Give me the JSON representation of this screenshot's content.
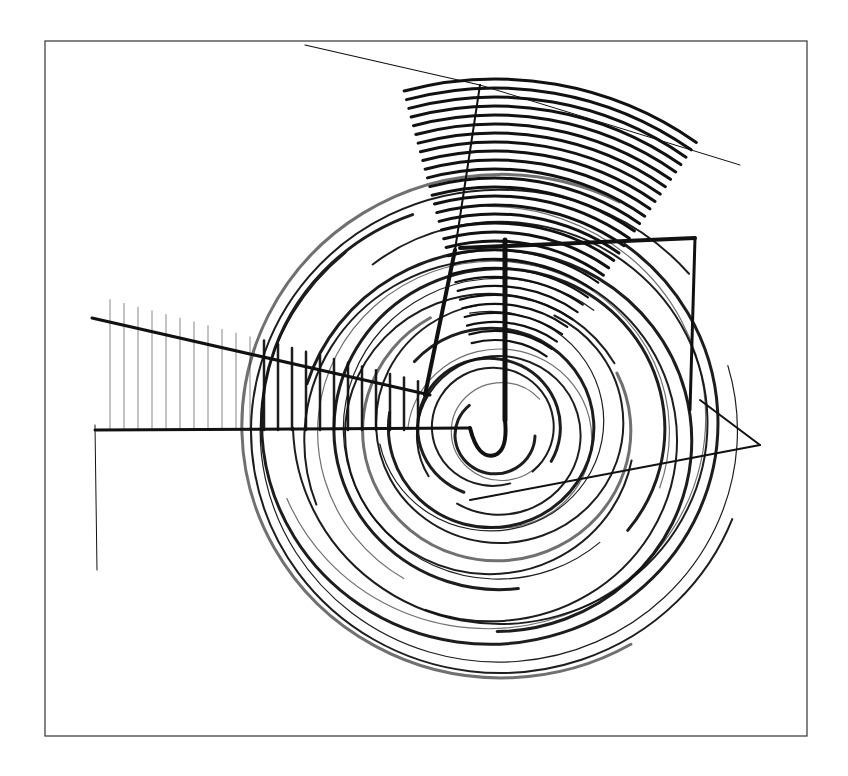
{
  "artwork": {
    "description": "Abstract pencil drawing: concentric spiral circles with hatched wedge forms",
    "frame": {
      "x": 45,
      "y": 41,
      "width": 762,
      "height": 695,
      "stroke": "#333333"
    },
    "center": {
      "x": 495,
      "y": 430
    },
    "colors": {
      "ink": "#111111",
      "paper": "#ffffff",
      "frame": "#333333"
    },
    "ring_count": 22,
    "max_radius": 270
  }
}
